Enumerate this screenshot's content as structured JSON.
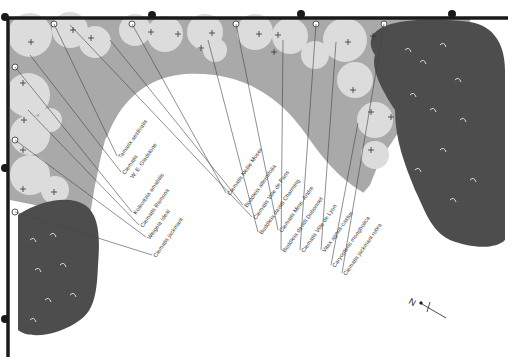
{
  "diagram": {
    "type": "planting-plan",
    "colors": {
      "background": "#ffffff",
      "wall": "#1a1a1a",
      "bed_mid": "#a9a9a9",
      "bed_light": "#d9d9d9",
      "shrub_dark": "#4a4a4a",
      "lawn": "#ffffff"
    },
    "labels": [
      {
        "text": "Tamarix aestivalis",
        "x": 117,
        "y": 156,
        "rot": -55
      },
      {
        "text": "Clematis",
        "x": 121,
        "y": 172,
        "rot": -55
      },
      {
        "text": "W. E. Gladstone",
        "x": 129,
        "y": 176,
        "rot": -55
      },
      {
        "text": "Kolkwitzia amabilis",
        "x": 132,
        "y": 212,
        "rot": -55
      },
      {
        "text": "Clematis Ramona",
        "x": 139,
        "y": 225,
        "rot": -55
      },
      {
        "text": "Weigela Ideal",
        "x": 146,
        "y": 237,
        "rot": -55
      },
      {
        "text": "Clematis jackmani",
        "x": 152,
        "y": 255,
        "rot": -55
      },
      {
        "text": "Clematis Nellie Moser",
        "x": 226,
        "y": 193,
        "rot": -55
      },
      {
        "text": "Buddleia alternifolia",
        "x": 243,
        "y": 205,
        "rot": -55
      },
      {
        "text": "Clematis Ville de Paris",
        "x": 252,
        "y": 217,
        "rot": -55
      },
      {
        "text": "Buddleia davidi Charming",
        "x": 258,
        "y": 232,
        "rot": -55
      },
      {
        "text": "Clematis Mme. Andre",
        "x": 278,
        "y": 230,
        "rot": -55
      },
      {
        "text": "Buddleia davidi Dubonnet",
        "x": 281,
        "y": 250,
        "rot": -55
      },
      {
        "text": "Clematis Ville de Lyon",
        "x": 300,
        "y": 250,
        "rot": -55
      },
      {
        "text": "Vitex agnus-castus",
        "x": 321,
        "y": 250,
        "rot": -55
      },
      {
        "text": "Caryopteris mongholica",
        "x": 331,
        "y": 265,
        "rot": -55
      },
      {
        "text": "Clematis jackmani rubra",
        "x": 342,
        "y": 273,
        "rot": -55
      }
    ],
    "compass": {
      "label": "N"
    }
  }
}
